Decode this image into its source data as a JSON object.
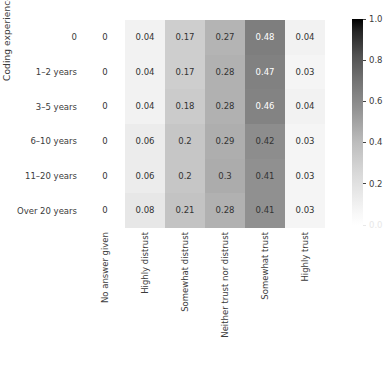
{
  "chart_data": {
    "type": "heatmap",
    "title": "",
    "xlabel": "",
    "ylabel": "Coding experience",
    "categories_x": [
      "No answer given",
      "Highly distrust",
      "Somewhat distrust",
      "Neither trust nor distrust",
      "Somewhat trust",
      "Highly trust"
    ],
    "categories_y": [
      "0",
      "1–2 years",
      "3–5 years",
      "6–10 years",
      "11–20 years",
      "Over 20 years"
    ],
    "values": [
      [
        0,
        0.04,
        0.17,
        0.27,
        0.48,
        0.04
      ],
      [
        0,
        0.04,
        0.17,
        0.28,
        0.47,
        0.03
      ],
      [
        0,
        0.04,
        0.18,
        0.28,
        0.46,
        0.04
      ],
      [
        0,
        0.06,
        0.2,
        0.29,
        0.42,
        0.03
      ],
      [
        0,
        0.06,
        0.2,
        0.3,
        0.41,
        0.03
      ],
      [
        0,
        0.08,
        0.21,
        0.28,
        0.41,
        0.03
      ]
    ],
    "cell_labels": [
      [
        "0",
        "0.04",
        "0.17",
        "0.27",
        "0.48",
        "0.04"
      ],
      [
        "0",
        "0.04",
        "0.17",
        "0.28",
        "0.47",
        "0.03"
      ],
      [
        "0",
        "0.04",
        "0.18",
        "0.28",
        "0.46",
        "0.04"
      ],
      [
        "0",
        "0.06",
        "0.2",
        "0.29",
        "0.42",
        "0.03"
      ],
      [
        "0",
        "0.06",
        "0.2",
        "0.3",
        "0.41",
        "0.03"
      ],
      [
        "0",
        "0.08",
        "0.21",
        "0.28",
        "0.41",
        "0.03"
      ]
    ],
    "colormap": "Greys",
    "colorbar": {
      "min": 0.0,
      "max": 1.0,
      "ticks": [
        0.0,
        0.2,
        0.4,
        0.6,
        0.8,
        1.0
      ],
      "tick_labels": [
        "0.0",
        "0.2",
        "0.4",
        "0.6",
        "0.8",
        "1.0"
      ],
      "position": "right",
      "orientation": "vertical",
      "low_color": "#ffffff",
      "high_color": "#000000"
    },
    "grid": false,
    "annotations": true,
    "vmin": 0.0,
    "vmax": 1.0
  },
  "axes": {
    "ylabel": "Coding experience",
    "xlabel": ""
  },
  "style": {
    "text_color": "#3b3b3b",
    "background": "#ffffff",
    "annotation_dark": "#333333",
    "annotation_light": "#ffffff"
  }
}
